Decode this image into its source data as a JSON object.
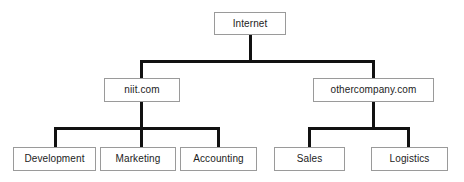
{
  "diagram": {
    "type": "network-hierarchy-tree",
    "background_color": "#ffffff",
    "box_border_color": "#9a9a9a",
    "connector_color": "#111111",
    "text_color": "#1c1c1c",
    "levels": [
      {
        "level": 0,
        "name": "root",
        "nodes": [
          {
            "id": "internet",
            "label": "Internet"
          }
        ]
      },
      {
        "level": 1,
        "name": "domains",
        "nodes": [
          {
            "id": "niit",
            "label": "niit.com",
            "parent": "internet"
          },
          {
            "id": "othercompany",
            "label": "othercompany.com",
            "parent": "internet"
          }
        ]
      },
      {
        "level": 2,
        "name": "departments",
        "nodes": [
          {
            "id": "development",
            "label": "Development",
            "parent": "niit"
          },
          {
            "id": "marketing",
            "label": "Marketing",
            "parent": "niit"
          },
          {
            "id": "accounting",
            "label": "Accounting",
            "parent": "niit"
          },
          {
            "id": "sales",
            "label": "Sales",
            "parent": "othercompany"
          },
          {
            "id": "logistics",
            "label": "Logistics",
            "parent": "othercompany"
          }
        ]
      }
    ]
  },
  "nodes": {
    "internet": {
      "label": "Internet"
    },
    "niit": {
      "label": "niit.com"
    },
    "othercompany": {
      "label": "othercompany.com"
    },
    "development": {
      "label": "Development"
    },
    "marketing": {
      "label": "Marketing"
    },
    "accounting": {
      "label": "Accounting"
    },
    "sales": {
      "label": "Sales"
    },
    "logistics": {
      "label": "Logistics"
    }
  }
}
